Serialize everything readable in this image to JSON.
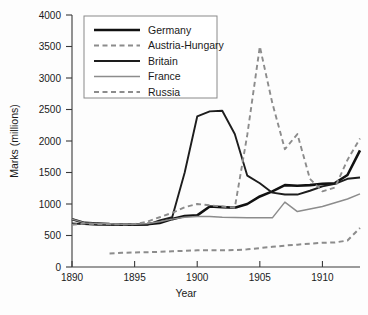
{
  "chart_data": {
    "type": "line",
    "title": "",
    "xlabel": "Year",
    "ylabel": "Marks (millions)",
    "xlim": [
      1890,
      1913
    ],
    "ylim": [
      0,
      4000
    ],
    "xticks": [
      1890,
      1895,
      1900,
      1905,
      1910
    ],
    "yticks": [
      0,
      500,
      1000,
      1500,
      2000,
      2500,
      3000,
      3500,
      4000
    ],
    "grid": false,
    "legend_position": "top-left-inside",
    "series": [
      {
        "name": "Germany",
        "style": "solid",
        "color": "#111111",
        "width": 2.6,
        "x": [
          1890,
          1891,
          1892,
          1893,
          1894,
          1895,
          1896,
          1897,
          1898,
          1899,
          1900,
          1901,
          1902,
          1903,
          1904,
          1905,
          1906,
          1907,
          1908,
          1909,
          1910,
          1911,
          1912,
          1913
        ],
        "y": [
          760,
          700,
          690,
          680,
          675,
          675,
          680,
          700,
          760,
          810,
          820,
          960,
          950,
          940,
          1000,
          1120,
          1200,
          1300,
          1290,
          1300,
          1320,
          1330,
          1460,
          1850
        ]
      },
      {
        "name": "Austria-Hungary",
        "style": "dashed",
        "color": "#8c8c8c",
        "width": 2.0,
        "x": [
          1893,
          1894,
          1895,
          1896,
          1897,
          1898,
          1899,
          1900,
          1901,
          1902,
          1903,
          1904,
          1905,
          1906,
          1907,
          1908,
          1909,
          1910,
          1911,
          1912,
          1913
        ],
        "y": [
          215,
          225,
          230,
          235,
          240,
          250,
          255,
          265,
          265,
          265,
          270,
          280,
          300,
          320,
          340,
          355,
          370,
          385,
          390,
          420,
          620
        ]
      },
      {
        "name": "Britain",
        "style": "solid",
        "color": "#1d1d1d",
        "width": 1.9,
        "x": [
          1890,
          1891,
          1892,
          1893,
          1894,
          1895,
          1896,
          1897,
          1898,
          1899,
          1900,
          1901,
          1902,
          1903,
          1904,
          1905,
          1906,
          1907,
          1908,
          1909,
          1910,
          1911,
          1912,
          1913
        ],
        "y": [
          690,
          680,
          670,
          670,
          665,
          665,
          670,
          740,
          790,
          1500,
          2390,
          2470,
          2480,
          2110,
          1450,
          1330,
          1180,
          1150,
          1150,
          1210,
          1280,
          1320,
          1400,
          1420
        ]
      },
      {
        "name": "France",
        "style": "solid",
        "color": "#8c8c8c",
        "width": 1.5,
        "x": [
          1890,
          1891,
          1892,
          1893,
          1894,
          1895,
          1896,
          1897,
          1898,
          1899,
          1900,
          1901,
          1902,
          1903,
          1904,
          1905,
          1906,
          1907,
          1908,
          1909,
          1910,
          1911,
          1912,
          1913
        ],
        "y": [
          760,
          700,
          690,
          685,
          680,
          680,
          690,
          720,
          760,
          790,
          800,
          800,
          790,
          785,
          780,
          780,
          780,
          1030,
          880,
          920,
          960,
          1020,
          1080,
          1160
        ]
      },
      {
        "name": "Russia",
        "style": "dashed",
        "color": "#8c8c8c",
        "width": 1.9,
        "x": [
          1890,
          1891,
          1892,
          1893,
          1894,
          1895,
          1896,
          1897,
          1898,
          1899,
          1900,
          1901,
          1902,
          1903,
          1904,
          1905,
          1906,
          1907,
          1908,
          1909,
          1910,
          1911,
          1912,
          1913
        ],
        "y": [
          670,
          690,
          680,
          680,
          675,
          680,
          720,
          790,
          860,
          950,
          1000,
          980,
          960,
          940,
          2100,
          3500,
          2600,
          1870,
          2110,
          1400,
          1200,
          1260,
          1700,
          2040
        ]
      }
    ]
  },
  "legend": {
    "items": [
      {
        "label": "Germany"
      },
      {
        "label": "Austria-Hungary"
      },
      {
        "label": "Britain"
      },
      {
        "label": "France"
      },
      {
        "label": "Russia"
      }
    ]
  },
  "axes": {
    "y_tick_labels": [
      "4000",
      "3500",
      "3000",
      "2500",
      "2000",
      "1500",
      "1000",
      "500",
      "0"
    ],
    "x_tick_labels": [
      "1890",
      "1895",
      "1900",
      "1905",
      "1910"
    ],
    "y_title": "Marks (millions)",
    "x_title": "Year"
  }
}
